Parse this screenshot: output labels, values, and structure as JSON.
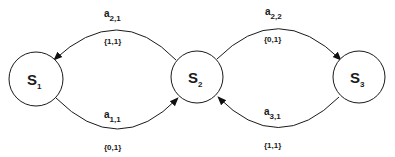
{
  "diagram": {
    "type": "state-transition",
    "states": [
      {
        "id": "S1",
        "label": "S",
        "sub": "1"
      },
      {
        "id": "S2",
        "label": "S",
        "sub": "2"
      },
      {
        "id": "S3",
        "label": "S",
        "sub": "3"
      }
    ],
    "transitions": [
      {
        "from": "S2",
        "to": "S1",
        "label": "a",
        "sub": "2,1",
        "output": "{1,1}"
      },
      {
        "from": "S1",
        "to": "S2",
        "label": "a",
        "sub": "1,1",
        "output": "{0,1}"
      },
      {
        "from": "S2",
        "to": "S3",
        "label": "a",
        "sub": "2,2",
        "output": "{0,1}"
      },
      {
        "from": "S3",
        "to": "S2",
        "label": "a",
        "sub": "3,1",
        "output": "{1,1}"
      }
    ],
    "colors": {
      "stroke": "#1a1a1a",
      "background": "#ffffff"
    }
  }
}
